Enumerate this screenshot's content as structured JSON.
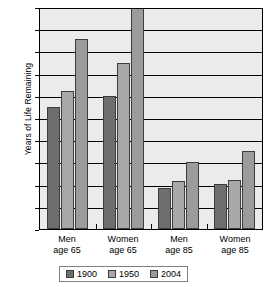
{
  "chart_data": {
    "type": "bar",
    "title": "",
    "xlabel": "",
    "ylabel": "Years of Life Remaining",
    "ylim": [
      0,
      20
    ],
    "ytick_step": 2,
    "yticks": [
      20,
      18,
      16,
      14,
      12,
      10,
      8,
      6,
      4,
      2,
      0
    ],
    "grid": true,
    "legend_position": "bottom",
    "categories": [
      "Men\nage 65",
      "Women\nage 65",
      "Men\nage 85",
      "Women\nage 85"
    ],
    "category_labels": [
      {
        "line1": "Men",
        "line2": "age 65"
      },
      {
        "line1": "Women",
        "line2": "age 65"
      },
      {
        "line1": "Men",
        "line2": "age 85"
      },
      {
        "line1": "Women",
        "line2": "age 85"
      }
    ],
    "series": [
      {
        "name": "1900",
        "color": "#6e6e6e",
        "values": [
          11.0,
          12.0,
          3.7,
          4.1
        ]
      },
      {
        "name": "1950",
        "color": "#a8a8a8",
        "values": [
          12.4,
          15.0,
          4.3,
          4.4
        ]
      },
      {
        "name": "2004",
        "color": "#9b9b9b",
        "values": [
          17.1,
          20.0,
          6.0,
          7.0
        ]
      }
    ]
  },
  "colors": {
    "plot_background": "#ebebeb",
    "axis": "#000000",
    "series_1900": "#6e6e6e",
    "series_1950": "#a8a8a8",
    "series_2004": "#9b9b9b"
  }
}
